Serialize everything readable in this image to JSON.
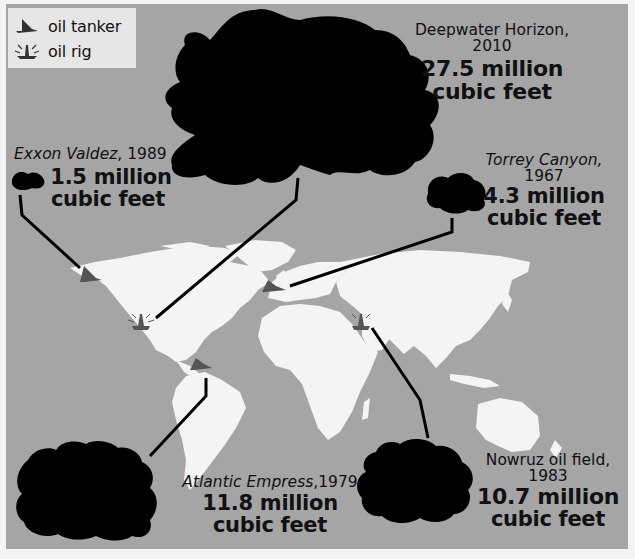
{
  "legend": {
    "items": [
      {
        "icon": "oil-tanker-icon",
        "label": "oil tanker"
      },
      {
        "icon": "oil-rig-icon",
        "label": "oil rig"
      }
    ]
  },
  "spills": {
    "deepwater": {
      "name": "Deepwater Horizon, 2010",
      "amount": "27.5 million",
      "unit": "cubic feet",
      "type": "oil rig"
    },
    "exxon": {
      "name": "Exxon Valdez",
      "year": ", 1989",
      "amount": "1.5 million",
      "unit": "cubic feet",
      "type": "oil tanker"
    },
    "torrey": {
      "name": "Torrey Canyon,",
      "year": "1967",
      "amount": "4.3 million",
      "unit": "cubic feet",
      "type": "oil tanker"
    },
    "atlantic": {
      "name": "Atlantic Empress",
      "year": ",1979",
      "amount": "11.8 million",
      "unit": "cubic feet",
      "type": "oil tanker"
    },
    "nowruz": {
      "name": "Nowruz oil field,",
      "year": "1983",
      "amount": "10.7 million",
      "unit": "cubic feet",
      "type": "oil rig"
    }
  },
  "colors": {
    "background": "#a5a5a5",
    "land": "#f4f4f4",
    "spill": "#000000",
    "legend_bg": "#e6e6e6",
    "icon": "#555555"
  }
}
